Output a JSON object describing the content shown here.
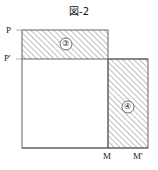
{
  "figure": {
    "title": "図-2",
    "type": "geometry-diagram",
    "background_color": "#ffffff",
    "line_color": "#4a4a4a",
    "hatch_color": "#7a7a7a",
    "labels": {
      "top_left_outer": "P",
      "left_step": "P'",
      "bottom_inner": "M",
      "bottom_outer": "M'"
    },
    "regions": [
      {
        "id": "region-3",
        "label": "③",
        "fill": "hatched",
        "hatch_direction": "45deg",
        "description": "upper horizontal hatched band between P and P'"
      },
      {
        "id": "region-4",
        "label": "④",
        "fill": "hatched",
        "hatch_direction": "45deg",
        "description": "right vertical hatched band between M and M'"
      }
    ],
    "geometry": {
      "inner_square": {
        "x": 22,
        "y": 59,
        "width": 86,
        "height": 89
      },
      "upper_band": {
        "x": 22,
        "y": 30,
        "width": 86,
        "height": 29
      },
      "right_band": {
        "x": 108,
        "y": 59,
        "width": 40,
        "height": 89
      },
      "baseline_y": 148,
      "left_edge_x": 22,
      "m_tick_x": 108,
      "m_prime_tick_x": 148,
      "p_line_y": 30,
      "p_prime_line_y": 59
    }
  }
}
